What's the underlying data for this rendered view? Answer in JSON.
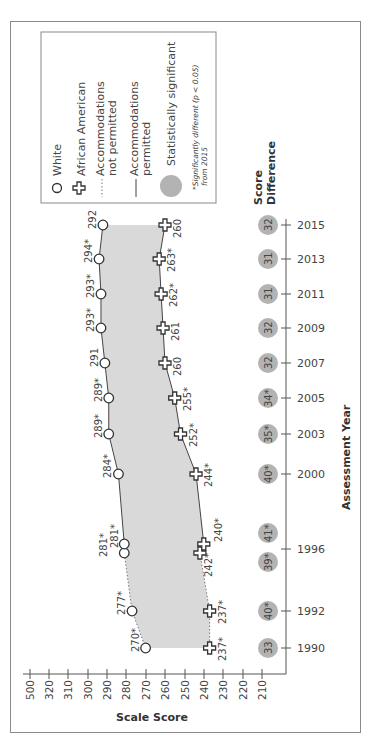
{
  "chart_data": {
    "type": "line",
    "orientation": "rotated-90-clockwise",
    "title": "",
    "xlabel": "Assessment Year",
    "ylabel": "Scale Score",
    "score_axis_ticks": [
      "500",
      "320",
      "310",
      "300",
      "290",
      "280",
      "270",
      "260",
      "250",
      "240",
      "230",
      "220",
      "210"
    ],
    "score_axis_break": "500 to 320 (axis break)",
    "year_axis_ticks": [
      "2015",
      "2013",
      "2011",
      "2009",
      "2007",
      "2005",
      "2003",
      "2000",
      "1996",
      "1992",
      "1990"
    ],
    "series": [
      {
        "name": "White",
        "marker": "circle",
        "points": [
          {
            "year": "1990",
            "value": 270,
            "label": "270*",
            "accommodations": "not permitted"
          },
          {
            "year": "1992",
            "value": 277,
            "label": "277*",
            "accommodations": "not permitted"
          },
          {
            "year": "1996",
            "value": 281,
            "label": "281*",
            "accommodations": "not permitted"
          },
          {
            "year": "1996",
            "value": 281,
            "label": "281*",
            "accommodations": "permitted"
          },
          {
            "year": "2000",
            "value": 284,
            "label": "284*",
            "accommodations": "permitted"
          },
          {
            "year": "2003",
            "value": 289,
            "label": "289*",
            "accommodations": "permitted"
          },
          {
            "year": "2005",
            "value": 289,
            "label": "289*",
            "accommodations": "permitted"
          },
          {
            "year": "2007",
            "value": 291,
            "label": "291",
            "accommodations": "permitted"
          },
          {
            "year": "2009",
            "value": 293,
            "label": "293*",
            "accommodations": "permitted"
          },
          {
            "year": "2011",
            "value": 293,
            "label": "293*",
            "accommodations": "permitted"
          },
          {
            "year": "2013",
            "value": 294,
            "label": "294*",
            "accommodations": "permitted"
          },
          {
            "year": "2015",
            "value": 292,
            "label": "292",
            "accommodations": "permitted"
          }
        ]
      },
      {
        "name": "African American",
        "marker": "cross",
        "points": [
          {
            "year": "1990",
            "value": 237,
            "label": "237*",
            "accommodations": "not permitted"
          },
          {
            "year": "1992",
            "value": 237,
            "label": "237*",
            "accommodations": "not permitted"
          },
          {
            "year": "1996",
            "value": 242,
            "label": "242*",
            "accommodations": "not permitted"
          },
          {
            "year": "1996",
            "value": 240,
            "label": "240*",
            "accommodations": "permitted"
          },
          {
            "year": "2000",
            "value": 244,
            "label": "244*",
            "accommodations": "permitted"
          },
          {
            "year": "2003",
            "value": 252,
            "label": "252*",
            "accommodations": "permitted"
          },
          {
            "year": "2005",
            "value": 255,
            "label": "255*",
            "accommodations": "permitted"
          },
          {
            "year": "2007",
            "value": 260,
            "label": "260",
            "accommodations": "permitted"
          },
          {
            "year": "2009",
            "value": 261,
            "label": "261",
            "accommodations": "permitted"
          },
          {
            "year": "2011",
            "value": 262,
            "label": "262*",
            "accommodations": "permitted"
          },
          {
            "year": "2013",
            "value": 263,
            "label": "263*",
            "accommodations": "permitted"
          },
          {
            "year": "2015",
            "value": 260,
            "label": "260",
            "accommodations": "permitted"
          }
        ]
      }
    ],
    "score_differences": {
      "title": "Score Difference",
      "values": [
        {
          "year": "2015",
          "label": "32"
        },
        {
          "year": "2013",
          "label": "31"
        },
        {
          "year": "2011",
          "label": "31"
        },
        {
          "year": "2009",
          "label": "32"
        },
        {
          "year": "2007",
          "label": "32"
        },
        {
          "year": "2005",
          "label": "34*"
        },
        {
          "year": "2003",
          "label": "35*"
        },
        {
          "year": "2000",
          "label": "40*"
        },
        {
          "year": "1996",
          "label": "41*",
          "accommodations": "permitted"
        },
        {
          "year": "1996",
          "label": "39*",
          "accommodations": "not permitted"
        },
        {
          "year": "1992",
          "label": "40*"
        },
        {
          "year": "1990",
          "label": "33"
        }
      ]
    },
    "legend": {
      "position": "top-left",
      "items": [
        "White",
        "African American",
        "Accommodations not permitted",
        "Accommodations permitted",
        "Statistically significant"
      ],
      "note": "*Significantly different (p < 0.05) from 2015"
    },
    "grid": false
  },
  "legend": {
    "white": "White",
    "african_american": "African American",
    "not_permitted_1": "Accommodations",
    "not_permitted_2": "not permitted",
    "permitted_1": "Accommodations",
    "permitted_2": "permitted",
    "significant": "Statistically significant",
    "note_1": "*Significantly different (p < 0.05)",
    "note_2": "from 2015"
  },
  "axes": {
    "score_label": "Scale Score",
    "year_label": "Assessment Year",
    "diff_title_1": "Score",
    "diff_title_2": "Difference"
  },
  "colors": {
    "fill_band": "#d9d9d9",
    "significant_circle": "#b3b3b3",
    "line": "#444444",
    "frame": "#8a8a8a"
  }
}
